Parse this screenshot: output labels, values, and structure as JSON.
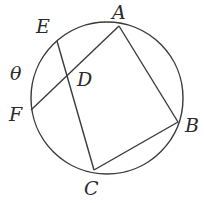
{
  "diagram": {
    "type": "circle-geometry",
    "stroke_color": "#3a3a3a",
    "circle": {
      "cx": 107,
      "cy": 98,
      "r": 76
    },
    "points": {
      "A": {
        "label": "A",
        "x": 119,
        "y": 26,
        "label_x": 112,
        "label_y": 19
      },
      "B": {
        "label": "B",
        "x": 178,
        "y": 122,
        "label_x": 185,
        "label_y": 132
      },
      "C": {
        "label": "C",
        "x": 94,
        "y": 170,
        "label_x": 84,
        "label_y": 195
      },
      "D": {
        "label": "D",
        "x": 68,
        "y": 78,
        "label_x": 77,
        "label_y": 86
      },
      "E": {
        "label": "E",
        "x": 57,
        "y": 41,
        "label_x": 36,
        "label_y": 33
      },
      "F": {
        "label": "F",
        "x": 31,
        "y": 110,
        "label_x": 9,
        "label_y": 121
      }
    },
    "angle_label": {
      "text": "θ",
      "x": 10,
      "y": 80
    },
    "segments": [
      {
        "from": "A",
        "to": "B"
      },
      {
        "from": "B",
        "to": "C"
      },
      {
        "from": "E",
        "to": "C"
      },
      {
        "from": "A",
        "to": "F"
      }
    ]
  }
}
